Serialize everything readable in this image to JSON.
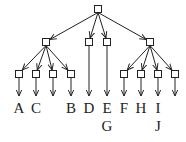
{
  "diagram": {
    "type": "tree",
    "root": {
      "x": 98,
      "y": 9
    },
    "mid_nodes": [
      {
        "id": "m1",
        "x": 46,
        "y": 42
      },
      {
        "id": "m2",
        "x": 89,
        "y": 42
      },
      {
        "id": "m3",
        "x": 107,
        "y": 42
      },
      {
        "id": "m4",
        "x": 150,
        "y": 42
      }
    ],
    "leaf_nodes": [
      {
        "x": 19,
        "y": 74,
        "parent": "m1"
      },
      {
        "x": 36,
        "y": 74,
        "parent": "m1"
      },
      {
        "x": 53,
        "y": 74,
        "parent": "m1"
      },
      {
        "x": 71,
        "y": 74,
        "parent": "m1"
      },
      {
        "x": 124,
        "y": 74,
        "parent": "m4"
      },
      {
        "x": 141,
        "y": 74,
        "parent": "m4"
      },
      {
        "x": 158,
        "y": 74,
        "parent": "m4"
      },
      {
        "x": 175,
        "y": 74,
        "parent": "m4"
      }
    ],
    "labels": [
      {
        "text": "A",
        "x": 19,
        "y": 113
      },
      {
        "text": "C",
        "x": 36,
        "y": 113
      },
      {
        "text": "B",
        "x": 71,
        "y": 113
      },
      {
        "text": "D",
        "x": 89,
        "y": 113
      },
      {
        "text": "E",
        "x": 107,
        "y": 113
      },
      {
        "text": "F",
        "x": 124,
        "y": 113
      },
      {
        "text": "H",
        "x": 141,
        "y": 113
      },
      {
        "text": "I",
        "x": 158,
        "y": 113
      },
      {
        "text": "G",
        "x": 107,
        "y": 131
      },
      {
        "text": "J",
        "x": 158,
        "y": 131
      }
    ],
    "colors": {
      "stroke": "#222222",
      "fill": "#ffffff"
    }
  }
}
